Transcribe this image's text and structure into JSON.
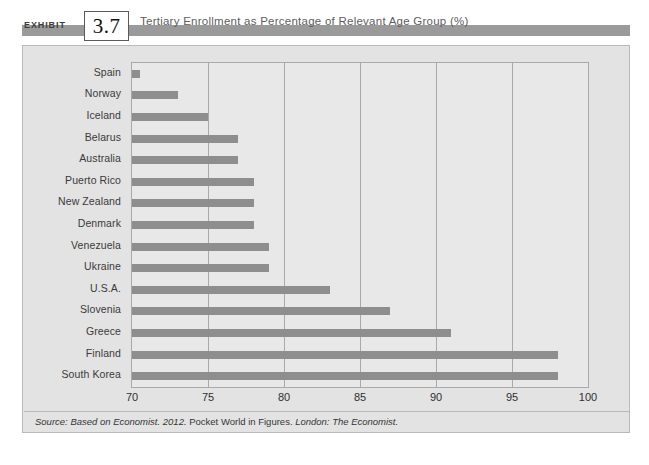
{
  "exhibit": {
    "label": "EXHIBIT",
    "number": "3.7",
    "title": "Tertiary Enrollment as Percentage of Relevant Age Group (%)"
  },
  "source": {
    "prefix": "Source: Based on Economist. 2012.",
    "middle": "Pocket World in Figures.",
    "suffix": "London: The Economist."
  },
  "colors": {
    "bar": "#8e8e8e",
    "header_band": "#9a9a9a",
    "plot_background": "#e8e8e8",
    "frame_background": "#e3e3e3",
    "gridline": "#a9a9a9",
    "page_background": "#ffffff"
  },
  "chart_data": {
    "type": "bar",
    "orientation": "horizontal",
    "title": "Tertiary Enrollment as Percentage of Relevant Age Group (%)",
    "xlabel": "",
    "ylabel": "",
    "xlim": [
      70,
      100
    ],
    "xticks": [
      70,
      75,
      80,
      85,
      90,
      95,
      100
    ],
    "grid": true,
    "legend": false,
    "categories": [
      "Spain",
      "Norway",
      "Iceland",
      "Belarus",
      "Australia",
      "Puerto Rico",
      "New Zealand",
      "Denmark",
      "Venezuela",
      "Ukraine",
      "U.S.A.",
      "Slovenia",
      "Greece",
      "Finland",
      "South Korea"
    ],
    "values": [
      70.5,
      73,
      75,
      77,
      77,
      78,
      78,
      78,
      79,
      79,
      83,
      87,
      91,
      98,
      98
    ],
    "units": "%"
  }
}
